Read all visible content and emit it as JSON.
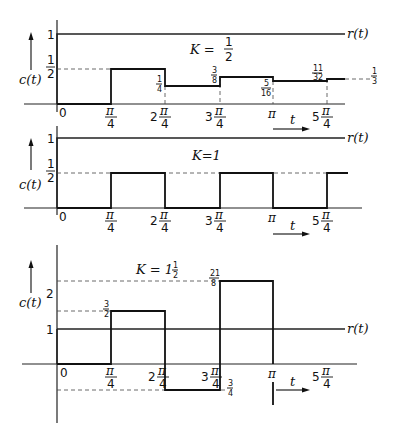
{
  "figure": {
    "panels": [
      {
        "id": "panel-k-half",
        "gain_label": "K = 1/2",
        "y_label": "c(t)",
        "ref_label": "r(t)",
        "y_ticks": [
          "1",
          "1/2"
        ],
        "x_ticks": [
          "0",
          "π/4",
          "2π/4",
          "3π/4",
          "π",
          "5π/4"
        ],
        "t_label": "t",
        "annotations": [
          "1/4",
          "3/8",
          "5/16",
          "11/32",
          "1/3"
        ]
      },
      {
        "id": "panel-k-one",
        "gain_label": "K = 1",
        "y_label": "c(t)",
        "ref_label": "r(t)",
        "y_ticks": [
          "1",
          "1/2"
        ],
        "x_ticks": [
          "0",
          "π/4",
          "2π/4",
          "3π/4",
          "π",
          "5π/4"
        ],
        "t_label": "t"
      },
      {
        "id": "panel-k-one-half",
        "gain_label": "K = 1 1/2",
        "y_label": "c(t)",
        "ref_label": "r(t)",
        "y_ticks": [
          "2",
          "1"
        ],
        "x_ticks": [
          "0",
          "π/4",
          "2π/4",
          "3π/4",
          "π",
          "5π/4"
        ],
        "t_label": "t",
        "annotations": [
          "3/2",
          "21/8",
          "-3/4"
        ]
      }
    ]
  },
  "labels": {
    "c": "c(t)",
    "r": "r(t)",
    "t": "t",
    "zero": "0",
    "one": "1",
    "two": "2",
    "pi": "π",
    "four": "4",
    "n2": "2",
    "n3": "3",
    "n5": "5",
    "k1": "K = ",
    "k1_num": "1",
    "k1_den": "2",
    "k2": "K=1",
    "k3": "K = 1",
    "k3_num": "1",
    "k3_den": "2",
    "f_1_2_n": "1",
    "f_1_2_d": "2",
    "f_1_4_n": "1",
    "f_1_4_d": "4",
    "f_3_8_n": "3",
    "f_3_8_d": "8",
    "f_5_16_n": "5",
    "f_5_16_d": "16",
    "f_11_32_n": "11",
    "f_11_32_d": "32",
    "f_1_3_n": "1",
    "f_1_3_d": "3",
    "f_3_2_n": "3",
    "f_3_2_d": "2",
    "f_21_8_n": "21",
    "f_21_8_d": "8",
    "f_3_4_n": "3",
    "f_3_4_d": "4"
  }
}
